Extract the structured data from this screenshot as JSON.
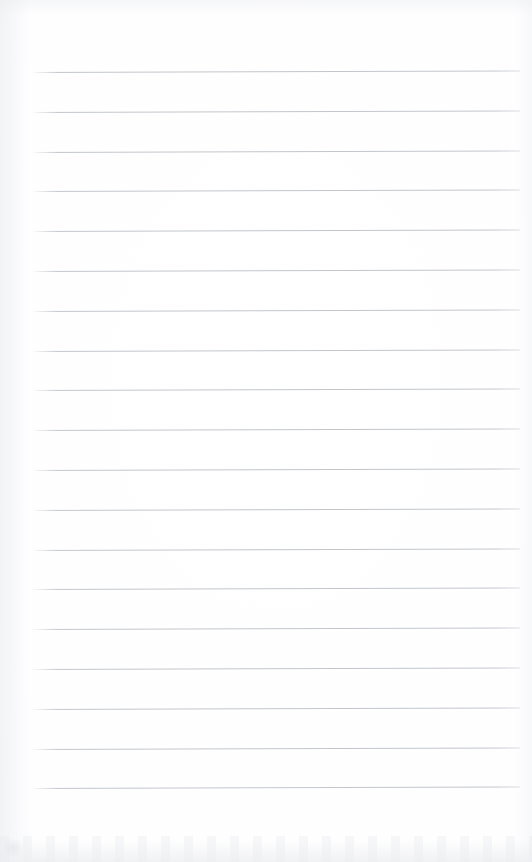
{
  "document": {
    "kind": "scanned-page",
    "page_type": "blank lined notebook page",
    "page_title": "",
    "header_text": "",
    "footer_text": "",
    "body_text": "",
    "page_number": "",
    "visible_text": []
  },
  "page": {
    "width": 532,
    "height": 862,
    "background_color": "#fefeff",
    "paper_tint": "#fdfdfe"
  },
  "ruling": {
    "type": "horizontal ruled lines",
    "line_color": "#bcc0c5",
    "line_thickness_px": 1,
    "line_count": 19,
    "first_line_y": 72,
    "line_spacing_px": 39.8,
    "last_line_y": 788,
    "line_start_x": 33,
    "line_end_x": 520,
    "line_length_px": 487,
    "skew_degrees": -0.175,
    "margin_rule": "none",
    "line_y_positions": [
      72,
      111.8,
      151.6,
      191.4,
      231.2,
      271,
      310.8,
      350.6,
      390.4,
      430.2,
      470,
      509.8,
      549.6,
      589.4,
      629.2,
      669,
      708.8,
      748.6,
      788.4
    ]
  },
  "margins": {
    "top_margin_px": 72,
    "bottom_margin_px": 74,
    "left_margin_px": 33,
    "right_margin_px": 12
  },
  "artifacts": {
    "bottom_edge_smudge": true,
    "left_edge_vignette": true,
    "corner_blot": true,
    "smudge_color": "#ecedf0"
  },
  "content": {
    "writing_slots": [
      "",
      "",
      "",
      "",
      "",
      "",
      "",
      "",
      "",
      "",
      "",
      "",
      "",
      "",
      "",
      "",
      "",
      "",
      ""
    ]
  }
}
